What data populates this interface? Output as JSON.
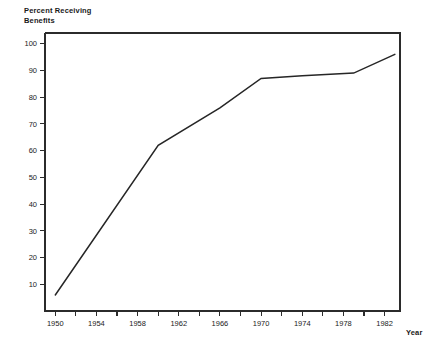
{
  "chart_data": {
    "type": "line",
    "title": "",
    "ylabel": "Percent Receiving\nBenefits",
    "ylabel_line1": "Percent Receiving",
    "ylabel_line2": "Benefits",
    "xlabel": "Year",
    "xlim": [
      1949,
      1983.5
    ],
    "ylim": [
      0,
      104
    ],
    "grid": false,
    "legend": null,
    "y_ticks": [
      10,
      20,
      30,
      40,
      50,
      60,
      70,
      80,
      90,
      100
    ],
    "y_tick_labels": [
      "10",
      "20",
      "30",
      "40",
      "50",
      "60",
      "70",
      "80",
      "90",
      "100"
    ],
    "x_ticks_major": [
      1950,
      1954,
      1958,
      1962,
      1966,
      1970,
      1974,
      1978,
      1982
    ],
    "x_tick_labels": [
      "1950",
      "1954",
      "1958",
      "1962",
      "1966",
      "1970",
      "1974",
      "1978",
      "1982"
    ],
    "x_ticks_minor": [
      1952,
      1956,
      1960,
      1964,
      1968,
      1972,
      1976,
      1980
    ],
    "series": [
      {
        "name": "Percent Receiving Benefits",
        "color": "#262626",
        "x": [
          1950,
          1960,
          1966,
          1970,
          1974,
          1979,
          1983
        ],
        "values": [
          6,
          62,
          76,
          87,
          88,
          89,
          96
        ]
      }
    ]
  },
  "colors": {
    "axis": "#2b2b2b",
    "line": "#262626",
    "background": "#ffffff",
    "text": "#1a1a1a"
  }
}
